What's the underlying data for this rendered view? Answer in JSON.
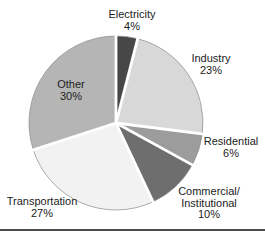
{
  "chart_data": {
    "type": "pie",
    "title": "",
    "units": "%",
    "direction": "clockwise",
    "start_angle_deg": 0,
    "separator_color": "#ffffff",
    "outline_color": "#909090",
    "background_color": "#ffffff",
    "bottom_rule_color": "#4b4b4b",
    "slices": [
      {
        "label": "Electricity",
        "label_lines": [
          "Electricity"
        ],
        "value": 4,
        "pct_label": "4%",
        "color": "#474747"
      },
      {
        "label": "Industry",
        "label_lines": [
          "Industry"
        ],
        "value": 23,
        "pct_label": "23%",
        "color": "#d8d8d8"
      },
      {
        "label": "Residential",
        "label_lines": [
          "Residential"
        ],
        "value": 6,
        "pct_label": "6%",
        "color": "#9c9c9c"
      },
      {
        "label": "Commercial/Institutional",
        "label_lines": [
          "Commercial/",
          "Institutional"
        ],
        "value": 10,
        "pct_label": "10%",
        "color": "#6e6e6e"
      },
      {
        "label": "Transportation",
        "label_lines": [
          "Transportation"
        ],
        "value": 27,
        "pct_label": "27%",
        "color": "#f2f2f2"
      },
      {
        "label": "Other",
        "label_lines": [
          "Other"
        ],
        "value": 30,
        "pct_label": "30%",
        "color": "#b5b5b5"
      }
    ]
  }
}
